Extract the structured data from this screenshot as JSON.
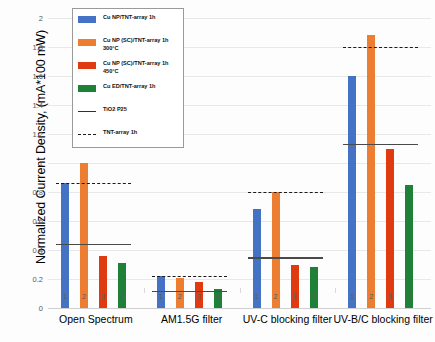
{
  "chart_data": {
    "type": "bar",
    "title": "",
    "xlabel": "",
    "ylabel": "Normalized Current Density, (mA*100 mW)",
    "ylim": [
      0,
      2
    ],
    "ytick_labels": [
      "0",
      "0.2",
      "0.4",
      "0.6",
      "0.8",
      "1",
      "1.2",
      "1.4",
      "1.6",
      "1.8",
      "2"
    ],
    "ytick_values": [
      0,
      0.2,
      0.4,
      0.6,
      0.8,
      1.0,
      1.2,
      1.4,
      1.6,
      1.8,
      2.0
    ],
    "grid": true,
    "legend_position": "upper-left-inset",
    "categories": [
      "Open Spectrum",
      "AM1.5G filter",
      "UV-C blocking filter",
      "UV-B/C blocking filter"
    ],
    "within_group_ticks": [
      "1",
      "2",
      "3",
      "4"
    ],
    "series": [
      {
        "name": "Cu NP/TNT-array 1h",
        "color": "#4472C4",
        "values": [
          0.86,
          0.22,
          0.68,
          1.6
        ]
      },
      {
        "name": "Cu NP (SC)/TNT-array 1h 300°C",
        "color": "#ED7D31",
        "values": [
          1.0,
          0.21,
          0.8,
          1.88
        ]
      },
      {
        "name": "Cu NP (SC)/TNT-array 1h 450°C",
        "color": "#E03B10",
        "values": [
          0.36,
          0.18,
          0.3,
          1.1
        ]
      },
      {
        "name": "Cu ED/TNT-array 1h",
        "color": "#1F8037",
        "values": [
          0.31,
          0.13,
          0.28,
          0.85
        ]
      }
    ],
    "reference_lines": [
      {
        "name": "TiO2 P25",
        "style": "solid",
        "color": "#4A4A4A",
        "values": [
          0.44,
          0.12,
          0.35,
          1.13
        ]
      },
      {
        "name": "TNT-array 1h",
        "style": "dashed",
        "color": "#1A1A1A",
        "values": [
          0.86,
          0.22,
          0.8,
          1.8
        ]
      }
    ]
  },
  "legend": {
    "items": [
      {
        "label": "Cu NP/TNT-array 1h",
        "marker": "swatch",
        "color": "#4472C4"
      },
      {
        "label": "Cu NP (SC)/TNT-array 1h\n300°C",
        "marker": "swatch",
        "color": "#ED7D31"
      },
      {
        "label": "Cu NP (SC)/TNT-array 1h\n450°C",
        "marker": "swatch",
        "color": "#E03B10"
      },
      {
        "label": "Cu ED/TNT-array 1h",
        "marker": "swatch",
        "color": "#1F8037"
      },
      {
        "label": "TiO2 P25",
        "marker": "line-solid",
        "color": "#2F2F2F"
      },
      {
        "label": "TNT-array 1h",
        "marker": "line-dashed",
        "color": "#1A1A1A"
      }
    ]
  },
  "axis": {
    "y_title": "Normalized Current Density, (mA*100 mW)"
  }
}
